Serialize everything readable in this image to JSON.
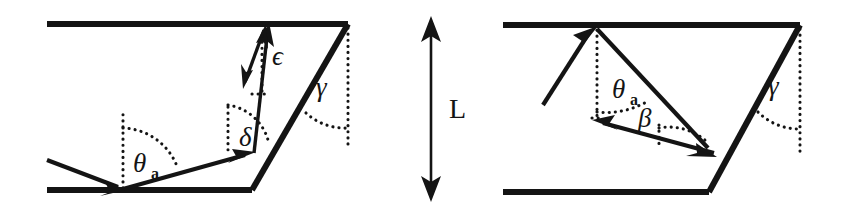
{
  "figure": {
    "background_color": "#ffffff",
    "ink_color": "#141414",
    "width": 844,
    "height": 218
  },
  "center_dimension": {
    "label": "L",
    "name": "waveguide-length",
    "arrow_style": "double-headed-vertical"
  },
  "left_panel": {
    "name": "left-diagram",
    "caption": "",
    "angles": [
      {
        "id": "theta_a",
        "symbol": "θ",
        "subscript": "a",
        "name": "angle-theta-a"
      },
      {
        "id": "delta",
        "symbol": "δ",
        "subscript": "",
        "name": "angle-delta"
      },
      {
        "id": "epsilon",
        "symbol": "ϵ",
        "subscript": "",
        "name": "angle-epsilon"
      },
      {
        "id": "gamma",
        "symbol": "γ",
        "subscript": "",
        "name": "angle-gamma"
      }
    ],
    "elements": [
      "top-wall",
      "bottom-wall",
      "slanted-right-wall",
      "incoming-ray",
      "reflected-ray-to-slant",
      "outgoing-ray-up",
      "double-headed-short-arrow",
      "normal-dotted-lines"
    ]
  },
  "right_panel": {
    "name": "right-diagram",
    "caption": "",
    "angles": [
      {
        "id": "theta_a",
        "symbol": "θ",
        "subscript": "a",
        "name": "angle-theta-a"
      },
      {
        "id": "beta",
        "symbol": "β",
        "subscript": "",
        "name": "angle-beta"
      },
      {
        "id": "gamma",
        "symbol": "γ",
        "subscript": "",
        "name": "angle-gamma"
      }
    ],
    "elements": [
      "top-wall",
      "bottom-wall",
      "slanted-right-wall",
      "incoming-ray",
      "ray-to-slant",
      "reflected-ray-left",
      "normal-dotted-lines"
    ]
  }
}
